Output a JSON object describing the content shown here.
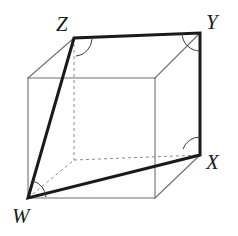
{
  "figure": {
    "type": "geometry-diagram",
    "shape": "cube",
    "projection": "oblique",
    "canvas": {
      "width": 238,
      "height": 236,
      "background": "#ffffff"
    },
    "colors": {
      "background": "#ffffff",
      "cube_edge_visible": "#6f6f6f",
      "cube_edge_hidden": "#8a8a8a",
      "cross_section": "#1a1a1a",
      "label_text": "#1a1a1a",
      "angle_mark": "#3a3a3a"
    },
    "stroke_widths": {
      "cube_edge": 1.1,
      "cube_edge_hidden": 1.0,
      "cross_section": 3.0,
      "angle_mark": 1.0
    },
    "hidden_edge_dash": "3,3"
  },
  "labels": [
    {
      "id": "Z",
      "text": "Z",
      "x": 56,
      "y": 14
    },
    {
      "id": "Y",
      "text": "Y",
      "x": 206,
      "y": 12
    },
    {
      "id": "X",
      "text": "X",
      "x": 206,
      "y": 152
    },
    {
      "id": "W",
      "text": "W",
      "x": 12,
      "y": 206
    }
  ],
  "vertices": {
    "front_top_left": {
      "x": 28,
      "y": 78
    },
    "front_top_right": {
      "x": 155,
      "y": 78
    },
    "front_bottom_right": {
      "x": 155,
      "y": 198
    },
    "front_bottom_left": {
      "x": 28,
      "y": 198
    },
    "back_top_left": {
      "x": 74,
      "y": 38
    },
    "back_top_right": {
      "x": 200,
      "y": 33
    },
    "back_bottom_right": {
      "x": 200,
      "y": 155
    },
    "back_bottom_left": {
      "x": 74,
      "y": 160
    }
  },
  "cross_section": {
    "name": "WZYX",
    "points": [
      {
        "label": "W",
        "x": 28,
        "y": 198
      },
      {
        "label": "Z",
        "x": 74,
        "y": 38
      },
      {
        "label": "Y",
        "x": 200,
        "y": 33
      },
      {
        "label": "X",
        "x": 200,
        "y": 155
      }
    ],
    "closed": true
  },
  "angle_marks": [
    {
      "at": "Z",
      "kind": "right-angle-arc",
      "x": 74,
      "y": 38
    },
    {
      "at": "Y",
      "kind": "right-angle-arc",
      "x": 200,
      "y": 33
    },
    {
      "at": "X",
      "kind": "right-angle-arc",
      "x": 200,
      "y": 155
    },
    {
      "at": "W",
      "kind": "right-angle-arc",
      "x": 28,
      "y": 198
    }
  ]
}
